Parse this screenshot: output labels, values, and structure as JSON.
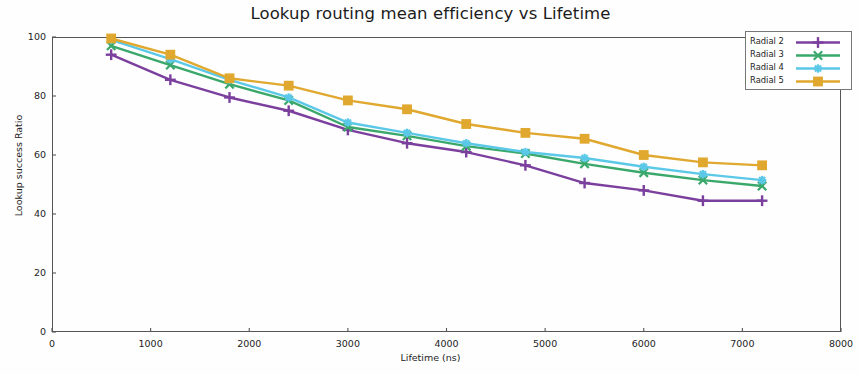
{
  "chart_data": {
    "type": "line",
    "title": "Lookup routing mean efficiency vs Lifetime",
    "xlabel": "Lifetime (ns)",
    "ylabel": "Lookup success Ratio",
    "xlim": [
      0,
      8000
    ],
    "ylim": [
      0,
      100
    ],
    "xticks": [
      0,
      1000,
      2000,
      3000,
      4000,
      5000,
      6000,
      7000,
      8000
    ],
    "yticks": [
      0,
      20,
      40,
      60,
      80,
      100
    ],
    "xtick_labels": [
      "0",
      "1000",
      "2000",
      "3000",
      "4000",
      "5000",
      "6000",
      "7000",
      "8000"
    ],
    "ytick_labels": [
      "0",
      "20",
      "40",
      "60",
      "80",
      "100"
    ],
    "grid": false,
    "legend_position": "top-right",
    "x": [
      600,
      1200,
      1800,
      2400,
      3000,
      3600,
      4200,
      4800,
      5400,
      6000,
      6600,
      7200
    ],
    "series": [
      {
        "name": "Radial 2",
        "color": "#7b3f9e",
        "marker": "plus",
        "values": [
          94.0,
          85.5,
          79.5,
          75.0,
          68.5,
          64.0,
          61.0,
          56.5,
          50.5,
          48.0,
          44.5,
          44.5
        ]
      },
      {
        "name": "Radial 3",
        "color": "#3aa86b",
        "marker": "x",
        "values": [
          97.0,
          90.5,
          84.0,
          78.5,
          69.5,
          66.5,
          63.0,
          60.5,
          57.0,
          54.0,
          51.5,
          49.5
        ]
      },
      {
        "name": "Radial 4",
        "color": "#5bc8e8",
        "marker": "star",
        "values": [
          99.0,
          92.5,
          85.5,
          79.5,
          71.0,
          67.5,
          64.0,
          61.0,
          59.0,
          56.0,
          53.5,
          51.5
        ]
      },
      {
        "name": "Radial 5",
        "color": "#e0a82e",
        "marker": "square",
        "values": [
          99.5,
          94.0,
          86.0,
          83.5,
          78.5,
          75.5,
          70.5,
          67.5,
          65.5,
          60.0,
          57.5,
          56.5
        ]
      }
    ]
  },
  "legend": {
    "entries": [
      {
        "label": "Radial 2"
      },
      {
        "label": "Radial 3"
      },
      {
        "label": "Radial 4"
      },
      {
        "label": "Radial 5"
      }
    ]
  }
}
